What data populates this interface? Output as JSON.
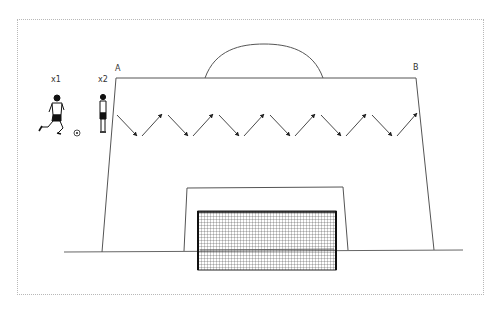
{
  "diagram": {
    "type": "soccer-drill",
    "labels": {
      "corner_a": "A",
      "corner_b": "B",
      "player_1": "x1",
      "player_2": "x2"
    },
    "colors": {
      "line": "#555555",
      "arrow": "#333333",
      "net": "#222222",
      "border": "#b8b8b8"
    },
    "zigzag_arrows": 12
  }
}
